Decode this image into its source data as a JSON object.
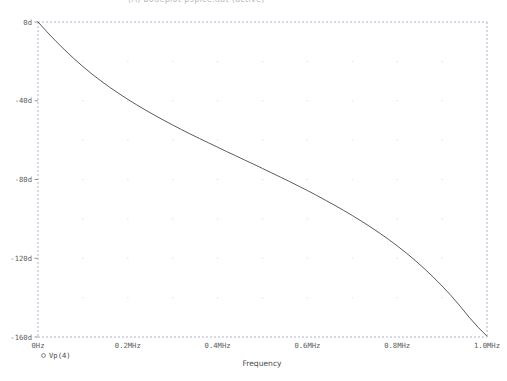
{
  "header": {
    "title": "(A) bodeplot-pspice.dat (active)"
  },
  "chart_data": {
    "type": "line",
    "title": "",
    "subtitle": "",
    "xlabel": "Frequency",
    "ylabel": "",
    "x_unit": "MHz",
    "y_unit": "d",
    "xlim": [
      0,
      1.0
    ],
    "ylim": [
      -160,
      0
    ],
    "grid": true,
    "grid_style": "dotted",
    "legend_position": "bottom-left",
    "x_tick_labels": [
      "0Hz",
      "0.2MHz",
      "0.4MHz",
      "0.6MHz",
      "0.8MHz",
      "1.0MHz"
    ],
    "x_ticks": [
      0,
      0.2,
      0.4,
      0.6,
      0.8,
      1.0
    ],
    "y_tick_labels": [
      "0d",
      "-40d",
      "-80d",
      "-120d",
      "-160d"
    ],
    "y_ticks": [
      0,
      -40,
      -80,
      -120,
      -160
    ],
    "series": [
      {
        "name": "Vp(4)",
        "marker": "circle-open",
        "color": "#3c3c3c",
        "x": [
          0.0,
          0.02,
          0.04,
          0.06,
          0.08,
          0.1,
          0.12,
          0.14,
          0.16,
          0.18,
          0.2,
          0.22,
          0.24,
          0.26,
          0.28,
          0.3,
          0.32,
          0.34,
          0.36,
          0.38,
          0.4,
          0.42,
          0.44,
          0.46,
          0.48,
          0.5,
          0.52,
          0.54,
          0.56,
          0.58,
          0.6,
          0.62,
          0.64,
          0.66,
          0.68,
          0.7,
          0.72,
          0.74,
          0.76,
          0.78,
          0.8,
          0.82,
          0.84,
          0.86,
          0.88,
          0.9,
          0.92,
          0.94,
          0.96,
          0.98,
          1.0
        ],
        "y": [
          0.0,
          -5.0,
          -9.8,
          -14.3,
          -18.6,
          -22.6,
          -26.4,
          -29.9,
          -33.2,
          -36.3,
          -39.3,
          -42.1,
          -44.8,
          -47.4,
          -49.9,
          -52.3,
          -54.7,
          -57.0,
          -59.2,
          -61.4,
          -63.6,
          -65.8,
          -67.9,
          -70.1,
          -72.2,
          -74.4,
          -76.6,
          -78.8,
          -81.0,
          -83.3,
          -85.6,
          -88.0,
          -90.5,
          -93.0,
          -95.6,
          -98.3,
          -101.1,
          -104.0,
          -107.1,
          -110.3,
          -113.7,
          -117.3,
          -121.1,
          -125.2,
          -129.5,
          -134.1,
          -139.0,
          -144.3,
          -149.9,
          -155.0,
          -159.6
        ]
      }
    ]
  },
  "legend": {
    "entries": [
      {
        "marker_label": "o",
        "label": "Vp(4)"
      }
    ]
  },
  "axis_titles": {
    "x": "Frequency"
  }
}
